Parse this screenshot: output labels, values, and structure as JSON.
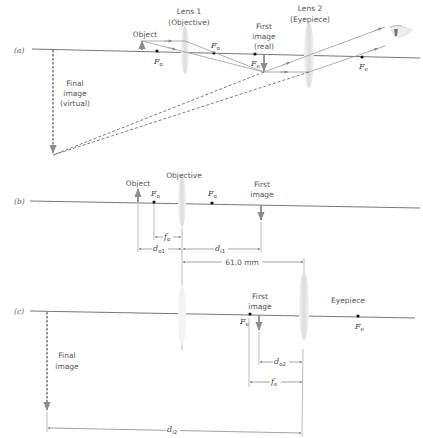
{
  "panels": {
    "a": {
      "label": "(a)",
      "lens1_title": "Lens 1",
      "lens1_sub": "(Objective)",
      "lens2_title": "Lens 2",
      "lens2_sub": "(Eyepiece)",
      "object": "Object",
      "first_image_1": "First",
      "first_image_2": "image",
      "first_image_3": "(real)",
      "final_image_1": "Final",
      "final_image_2": "image",
      "final_image_3": "(virtual)",
      "focal_o": "F",
      "focal_o_sub": "o",
      "focal_e": "F",
      "focal_e_sub": "e"
    },
    "b": {
      "label": "(b)",
      "objective": "Objective",
      "object": "Object",
      "first_image_1": "First",
      "first_image_2": "image",
      "focal_o": "F",
      "focal_o_sub": "o",
      "dim_fo": "f",
      "dim_fo_sub": "o",
      "dim_do1": "d",
      "dim_do1_sub": "o1",
      "dim_di1": "d",
      "dim_di1_sub": "i1",
      "dim_separation": "61.0 mm"
    },
    "c": {
      "label": "(c)",
      "eyepiece": "Eyepiece",
      "first_image_1": "First",
      "first_image_2": "image",
      "final_image_1": "Final",
      "final_image_2": "image",
      "focal_e": "F",
      "focal_e_sub": "e",
      "dim_do2": "d",
      "dim_do2_sub": "o2",
      "dim_fe": "f",
      "dim_fe_sub": "e",
      "dim_di2": "d",
      "dim_di2_sub": "i2"
    }
  },
  "colors": {
    "axis": "#555555",
    "ray": "#9a9a9a",
    "arrow": "#8c8c8c",
    "lens": "#e6e6e6",
    "dashed": "#444444",
    "text": "#555555"
  }
}
